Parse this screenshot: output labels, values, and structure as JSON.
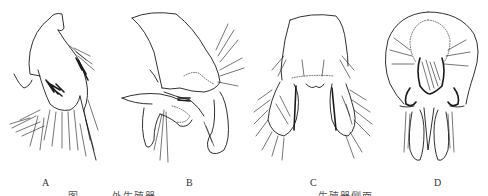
{
  "figure": {
    "panels": [
      {
        "label": "A",
        "description": "genitalia-lateral-view-A"
      },
      {
        "label": "B",
        "description": "genitalia-lateral-view-B"
      },
      {
        "label": "C",
        "description": "genitalia-dorsal-view-C"
      },
      {
        "label": "D",
        "description": "genitalia-ventral-view-D"
      }
    ],
    "caption_left": "图",
    "caption_mid": "外生殖器",
    "caption_right": "生殖器侧面"
  }
}
